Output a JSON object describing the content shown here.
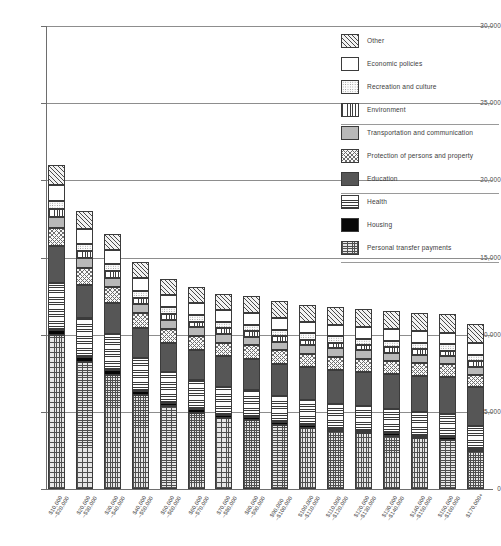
{
  "chart_data": {
    "type": "bar",
    "stacked": true,
    "title": "",
    "xlabel": "",
    "ylabel": "",
    "ylim": [
      0,
      30000
    ],
    "ytick_values": [
      0,
      5000,
      10000,
      15000,
      20000,
      25000,
      30000
    ],
    "ytick_labels": [
      "0",
      "5,000",
      "10,000",
      "15,000",
      "20,000",
      "25,000",
      "30,000"
    ],
    "grid": "horizontal",
    "legend_position": "top-right",
    "categories": [
      "$10,000–$20,000",
      "$20,000–$30,000",
      "$30,000–$40,000",
      "$40,000–$50,000",
      "$50,000–$60,000",
      "$60,000–$70,000",
      "$70,000–$80,000",
      "$80,000–$90,000",
      "$90,000–$100,000",
      "$100,000–$110,000",
      "$110,000–$120,000",
      "$120,000–$130,000",
      "$130,000–$140,000",
      "$140,000–$150,000",
      "$150,000–$160,000",
      "$170,000+"
    ],
    "category_lines": [
      [
        "$10,000",
        "–$20,000"
      ],
      [
        "$20,000",
        "–$30,000"
      ],
      [
        "$30,000",
        "–$40,000"
      ],
      [
        "$40,000",
        "–$50,000"
      ],
      [
        "$50,000",
        "–$60,000"
      ],
      [
        "$60,000",
        "–$70,000"
      ],
      [
        "$70,000",
        "–$80,000"
      ],
      [
        "$80,000",
        "–$90,000"
      ],
      [
        "$90,000",
        "–$100,000"
      ],
      [
        "$100,000",
        "–$110,000"
      ],
      [
        "$110,000",
        "–$120,000"
      ],
      [
        "$120,000",
        "–$130,000"
      ],
      [
        "$130,000",
        "–$140,000"
      ],
      [
        "$140,000",
        "–$150,000"
      ],
      [
        "$150,000",
        "–$160,000"
      ],
      [
        "$170,000+",
        ""
      ]
    ],
    "series": [
      {
        "name": "Personal transfer payments",
        "pattern": "crosshatch-grid",
        "swatch_class": "p-personal",
        "values": [
          9950,
          8250,
          7400,
          6100,
          5350,
          4950,
          4600,
          4450,
          4150,
          3950,
          3750,
          3600,
          3450,
          3300,
          3200,
          2450
        ]
      },
      {
        "name": "Housing",
        "pattern": "solid-black",
        "swatch_class": "p-housing",
        "values": [
          330,
          300,
          280,
          250,
          230,
          210,
          200,
          190,
          180,
          170,
          165,
          160,
          155,
          150,
          145,
          140
        ]
      },
      {
        "name": "Health",
        "pattern": "horizontal-lines",
        "swatch_class": "p-health",
        "values": [
          3050,
          2550,
          2350,
          2150,
          2000,
          1900,
          1800,
          1750,
          1700,
          1650,
          1620,
          1600,
          1580,
          1550,
          1520,
          1500
        ]
      },
      {
        "name": "Education",
        "pattern": "dark-gray-solid",
        "swatch_class": "p-education",
        "values": [
          2450,
          2150,
          2050,
          1950,
          1900,
          1950,
          2000,
          2050,
          2100,
          2150,
          2200,
          2250,
          2300,
          2350,
          2400,
          2500
        ]
      },
      {
        "name": "Protection of persons and property",
        "pattern": "diagonal-crosshatch",
        "swatch_class": "p-protection",
        "values": [
          1150,
          1050,
          1000,
          950,
          920,
          900,
          880,
          870,
          860,
          850,
          845,
          840,
          835,
          830,
          825,
          820
        ]
      },
      {
        "name": "Transportation and communication",
        "pattern": "gray-dots",
        "swatch_class": "p-transport",
        "values": [
          720,
          660,
          620,
          590,
          570,
          560,
          550,
          545,
          540,
          535,
          530,
          528,
          526,
          524,
          522,
          520
        ]
      },
      {
        "name": "Environment",
        "pattern": "vertical-lines",
        "swatch_class": "p-environment",
        "values": [
          480,
          440,
          420,
          400,
          390,
          385,
          380,
          375,
          372,
          370,
          368,
          366,
          364,
          362,
          360,
          358
        ]
      },
      {
        "name": "Recreation and culture",
        "pattern": "light-dots",
        "swatch_class": "p-recreation",
        "values": [
          540,
          500,
          470,
          450,
          440,
          430,
          425,
          420,
          418,
          415,
          412,
          410,
          408,
          406,
          404,
          402
        ]
      },
      {
        "name": "Economic policies",
        "pattern": "white-blank",
        "swatch_class": "p-economic",
        "values": [
          1020,
          940,
          880,
          830,
          800,
          790,
          780,
          775,
          770,
          768,
          765,
          763,
          760,
          758,
          756,
          754
        ]
      },
      {
        "name": "Other",
        "pattern": "diagonal-hatch",
        "swatch_class": "p-other",
        "values": [
          1310,
          1160,
          1080,
          1030,
          1000,
          1015,
          1035,
          1055,
          1080,
          1102,
          1125,
          1148,
          1172,
          1190,
          1208,
          1256
        ]
      }
    ],
    "totals": [
      21000,
      18000,
      16550,
      14700,
      13600,
      13090,
      12650,
      12480,
      12270,
      11960,
      11780,
      11665,
      11550,
      11420,
      11340,
      10700
    ]
  },
  "legend": {
    "entries": [
      "Other",
      "Economic policies",
      "Recreation and culture",
      "Environment",
      "Transportation and communication",
      "Protection of persons and property",
      "Education",
      "Health",
      "Housing",
      "Personal transfer payments"
    ]
  }
}
